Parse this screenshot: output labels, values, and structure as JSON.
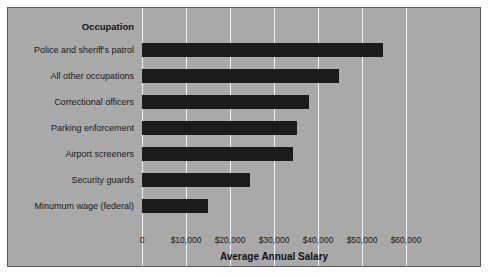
{
  "chart_data": {
    "type": "bar",
    "orientation": "horizontal",
    "title": "",
    "xlabel": "Average Annual Salary",
    "ylabel": "Occupation",
    "categories": [
      "Police and sheriff's patrol",
      "All other occupations",
      "Correctional officers",
      "Parking enforcement",
      "Airport screeners",
      "Security guards",
      "Minumum wage (federal)"
    ],
    "values": [
      54800,
      44800,
      38000,
      35200,
      34400,
      24600,
      15100
    ],
    "xlim": [
      0,
      60000
    ],
    "xticks": [
      0,
      10000,
      20000,
      30000,
      40000,
      50000,
      60000
    ],
    "xticklabels": [
      "0",
      "$10,000",
      "$20,000",
      "$30,000",
      "$40,000",
      "$50,000",
      "$60,000"
    ],
    "grid": "vertical",
    "legend": "none",
    "colors": {
      "bar": "#1c1c1c",
      "panel_background": "#a9a9a9",
      "gridline": "#f2f2f2",
      "frame": "#5a5a5a",
      "text": "#1a1a1a",
      "figure_background": "#ffffff"
    }
  }
}
